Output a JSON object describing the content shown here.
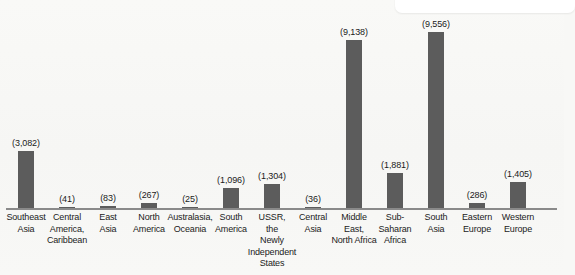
{
  "chart_data": {
    "type": "bar",
    "title": "",
    "subtitle": "",
    "xlabel": "",
    "ylabel": "",
    "grid": false,
    "legend": "none",
    "axis_visible": {
      "x": true,
      "y": false
    },
    "value_label_format": "(#,###)",
    "ylim": [
      0,
      9556
    ],
    "categories": [
      "Southeast Asia",
      "Central America, Caribbean",
      "East Asia",
      "North America",
      "Australasia, Oceania",
      "South America",
      "USSR, the Newly Independent States",
      "Central Asia",
      "Middle East, North Africa",
      "Sub-Saharan Africa",
      "South Asia",
      "Eastern Europe",
      "Western Europe"
    ],
    "values": [
      3082,
      41,
      83,
      267,
      25,
      1096,
      1304,
      36,
      9138,
      1881,
      9556,
      286,
      1405
    ],
    "bars": [
      {
        "category": "Southeast Asia",
        "label_lines": [
          "Southeast",
          "Asia"
        ],
        "value": 3082,
        "value_label": "(3,082)"
      },
      {
        "category": "Central America, Caribbean",
        "label_lines": [
          "Central",
          "America,",
          "Caribbean"
        ],
        "value": 41,
        "value_label": "(41)"
      },
      {
        "category": "East Asia",
        "label_lines": [
          "East",
          "Asia"
        ],
        "value": 83,
        "value_label": "(83)"
      },
      {
        "category": "North America",
        "label_lines": [
          "North",
          "America"
        ],
        "value": 267,
        "value_label": "(267)"
      },
      {
        "category": "Australasia, Oceania",
        "label_lines": [
          "Australasia,",
          "Oceania"
        ],
        "value": 25,
        "value_label": "(25)"
      },
      {
        "category": "South America",
        "label_lines": [
          "South",
          "America"
        ],
        "value": 1096,
        "value_label": "(1,096)"
      },
      {
        "category": "USSR, the Newly Independent States",
        "label_lines": [
          "USSR,",
          "the",
          "Newly",
          "Independent",
          "States"
        ],
        "value": 1304,
        "value_label": "(1,304)"
      },
      {
        "category": "Central Asia",
        "label_lines": [
          "Central",
          "Asia"
        ],
        "value": 36,
        "value_label": "(36)"
      },
      {
        "category": "Middle East, North Africa",
        "label_lines": [
          "Middle",
          "East,",
          "North Africa"
        ],
        "value": 9138,
        "value_label": "(9,138)"
      },
      {
        "category": "Sub-Saharan Africa",
        "label_lines": [
          "Sub-",
          "Saharan",
          "Africa"
        ],
        "value": 1881,
        "value_label": "(1,881)"
      },
      {
        "category": "South Asia",
        "label_lines": [
          "South",
          "Asia"
        ],
        "value": 9556,
        "value_label": "(9,556)"
      },
      {
        "category": "Eastern Europe",
        "label_lines": [
          "Eastern",
          "Europe"
        ],
        "value": 286,
        "value_label": "(286)"
      },
      {
        "category": "Western Europe",
        "label_lines": [
          "Western",
          "Europe"
        ],
        "value": 1405,
        "value_label": "(1,405)"
      }
    ]
  },
  "colors": {
    "bar": "#5c5c5c",
    "axis": "#8a8a8a",
    "text": "#1b1b1b",
    "background": "#f8f8f6",
    "overlay_panel": "#ffffff"
  }
}
